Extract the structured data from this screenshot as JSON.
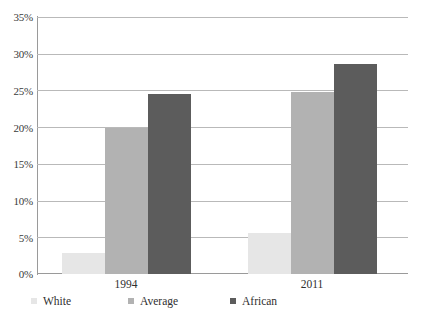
{
  "chart_data": {
    "type": "bar",
    "title": "",
    "subtitle": "",
    "xlabel": "",
    "ylabel": "",
    "categories": [
      "1994",
      "2011"
    ],
    "series": [
      {
        "name": "White",
        "values": [
          2.9,
          5.6
        ],
        "color": "#e6e6e6"
      },
      {
        "name": "Average",
        "values": [
          20.0,
          24.9
        ],
        "color": "#b2b2b2"
      },
      {
        "name": "African",
        "values": [
          24.6,
          28.7
        ],
        "color": "#5c5c5c"
      }
    ],
    "ylim": [
      0,
      35
    ],
    "y_ticks": [
      "0%",
      "5%",
      "10%",
      "15%",
      "20%",
      "25%",
      "30%",
      "35%"
    ],
    "y_tick_values": [
      0,
      5,
      10,
      15,
      20,
      25,
      30,
      35
    ],
    "grid": true,
    "grid_axis": "y",
    "legend_position": "bottom",
    "value_suffix": "%"
  },
  "axis": {
    "y": {
      "ticks": [
        {
          "label": "35%",
          "value": 35
        },
        {
          "label": "30%",
          "value": 30
        },
        {
          "label": "25%",
          "value": 25
        },
        {
          "label": "20%",
          "value": 20
        },
        {
          "label": "15%",
          "value": 15
        },
        {
          "label": "10%",
          "value": 10
        },
        {
          "label": "5%",
          "value": 5
        },
        {
          "label": "0%",
          "value": 0
        }
      ]
    },
    "x": {
      "ticks": [
        {
          "label": "1994"
        },
        {
          "label": "2011"
        }
      ]
    }
  },
  "legend": {
    "items": [
      {
        "label": "White",
        "color": "#e6e6e6"
      },
      {
        "label": "Average",
        "color": "#b2b2b2"
      },
      {
        "label": "African",
        "color": "#5c5c5c"
      }
    ]
  },
  "colors": {
    "white_series": "#e6e6e6",
    "average_series": "#b2b2b2",
    "african_series": "#5c5c5c",
    "grid": "#b9b9b9",
    "axis": "#9a9a9a",
    "text": "#2f2f2f",
    "background": "#ffffff"
  }
}
